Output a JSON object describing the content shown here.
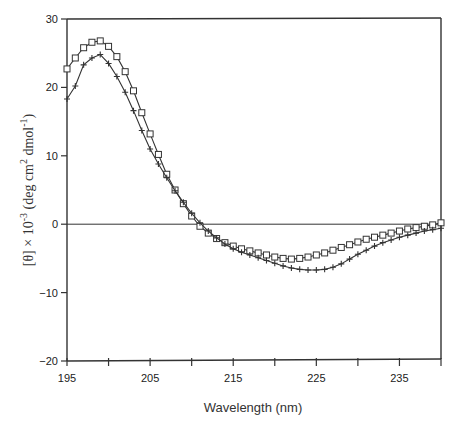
{
  "chart_data": {
    "type": "line",
    "title": "",
    "xlabel": "Wavelength (nm)",
    "ylabel": "[θ] × 10⁻³ (deg cm² dmol⁻¹)",
    "xlim": [
      195,
      240
    ],
    "ylim": [
      -20,
      30
    ],
    "xticks": [
      195,
      200,
      205,
      210,
      215,
      220,
      225,
      230,
      235,
      240
    ],
    "xtick_labels": [
      "195",
      "",
      "205",
      "",
      "215",
      "",
      "225",
      "",
      "235",
      ""
    ],
    "yticks": [
      -20,
      -10,
      0,
      10,
      20,
      30
    ],
    "ytick_labels": [
      "-20",
      "-10",
      "0",
      "10",
      "20",
      "30"
    ],
    "grid": false,
    "zero_line": true,
    "legend": null,
    "x": [
      195,
      196,
      197,
      198,
      199,
      200,
      201,
      202,
      203,
      204,
      205,
      206,
      207,
      208,
      209,
      210,
      211,
      212,
      213,
      214,
      215,
      216,
      217,
      218,
      219,
      220,
      221,
      222,
      223,
      224,
      225,
      226,
      227,
      228,
      229,
      230,
      231,
      232,
      233,
      234,
      235,
      236,
      237,
      238,
      239,
      240
    ],
    "series": [
      {
        "name": "squares",
        "marker": "square",
        "values": [
          22.7,
          24.3,
          25.8,
          26.6,
          26.8,
          26.0,
          24.5,
          22.3,
          19.5,
          16.3,
          13.2,
          10.2,
          7.3,
          5.0,
          3.0,
          1.2,
          -0.3,
          -1.3,
          -2.1,
          -2.7,
          -3.2,
          -3.6,
          -3.9,
          -4.2,
          -4.5,
          -4.8,
          -5.0,
          -5.1,
          -5.0,
          -4.8,
          -4.5,
          -4.2,
          -3.8,
          -3.4,
          -3.0,
          -2.6,
          -2.2,
          -1.9,
          -1.6,
          -1.3,
          -1.0,
          -0.7,
          -0.5,
          -0.3,
          -0.1,
          0.2
        ]
      },
      {
        "name": "plus",
        "marker": "plus",
        "values": [
          18.3,
          20.2,
          23.3,
          24.3,
          24.8,
          23.5,
          21.6,
          19.3,
          16.6,
          13.7,
          11.0,
          8.8,
          6.8,
          4.9,
          3.2,
          1.6,
          0.2,
          -1.0,
          -2.0,
          -2.9,
          -3.6,
          -4.1,
          -4.5,
          -4.9,
          -5.3,
          -5.7,
          -6.1,
          -6.4,
          -6.6,
          -6.7,
          -6.7,
          -6.6,
          -6.3,
          -5.8,
          -5.1,
          -4.4,
          -3.8,
          -3.2,
          -2.7,
          -2.3,
          -1.9,
          -1.6,
          -1.3,
          -1.0,
          -0.8,
          -0.6
        ]
      }
    ]
  },
  "labels": {
    "xaxis": "Wavelength (nm)",
    "yaxis_prefix": "[θ] × 10",
    "yaxis_exp": "-3",
    "yaxis_units_a": " (deg cm",
    "yaxis_units_sup2": "2",
    "yaxis_units_b": " dmol",
    "yaxis_units_sup3": "-1",
    "yaxis_units_c": ")"
  }
}
